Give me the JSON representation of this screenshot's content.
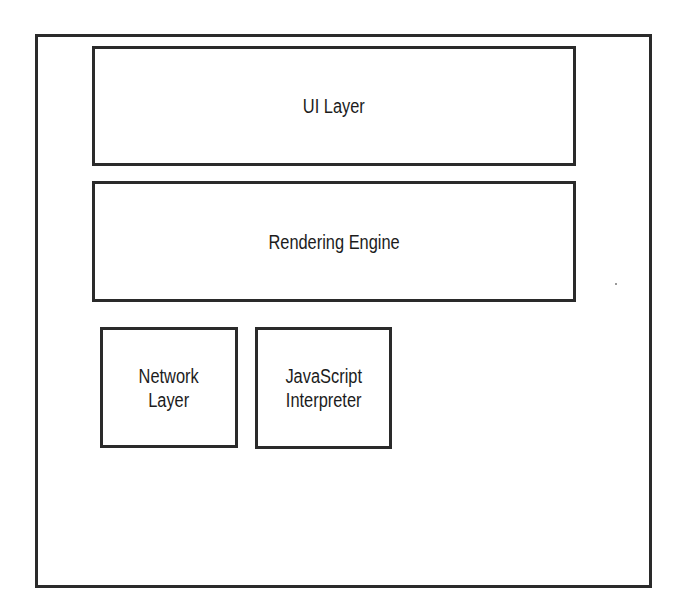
{
  "diagram": {
    "container": {
      "label": ""
    },
    "components": [
      {
        "id": "ui-layer",
        "label": "UI Layer"
      },
      {
        "id": "rendering-engine",
        "label": "Rendering Engine"
      },
      {
        "id": "network-layer",
        "label": "Network\nLayer"
      },
      {
        "id": "javascript-interpreter",
        "label": "JavaScript\nInterpreter"
      }
    ]
  },
  "colors": {
    "stroke": "#2a2a2a",
    "background": "#ffffff",
    "text": "#1c1c1c"
  }
}
